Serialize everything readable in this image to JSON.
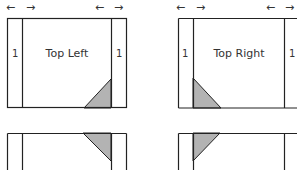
{
  "panels": {
    "top_left": {
      "title": "Top Left",
      "left_strip": "1",
      "right_strip": "1"
    },
    "top_right": {
      "title": "Top Right",
      "left_strip": "1",
      "right_strip": "1"
    }
  },
  "arrows": {
    "left": "←",
    "right": "→"
  },
  "colors": {
    "stroke": "#222222",
    "triangle_fill": "#b3b3b3"
  }
}
